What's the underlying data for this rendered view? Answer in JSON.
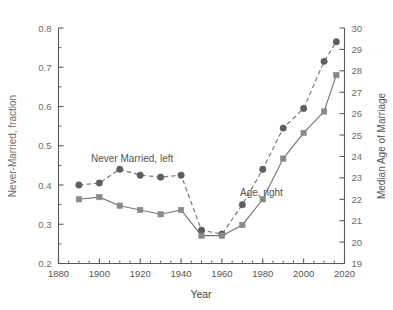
{
  "chart_data": {
    "type": "line",
    "title": "",
    "xlabel": "Year",
    "ylabel": "Never-Married, fraction",
    "y2label": "Median Age of Marriage",
    "xlim": [
      1880,
      2020
    ],
    "ylim": [
      0.2,
      0.8
    ],
    "y2lim": [
      19,
      30
    ],
    "grid": false,
    "legend_position": "inline-annotations",
    "x_ticks": [
      1880,
      1900,
      1920,
      1940,
      1960,
      1980,
      2000,
      2020
    ],
    "x_minor_step": 5,
    "y_ticks": [
      0.2,
      0.3,
      0.4,
      0.5,
      0.6,
      0.7,
      0.8
    ],
    "y_minor_step": 0.05,
    "y2_ticks": [
      19,
      20,
      21,
      22,
      23,
      24,
      25,
      26,
      27,
      28,
      29,
      30
    ],
    "annotations": [
      {
        "text": "Never Married, left",
        "x": 1905,
        "y": 0.5
      },
      {
        "text": "Age, right",
        "x": 1985,
        "y": 0.405
      }
    ],
    "x": [
      1890,
      1900,
      1910,
      1920,
      1930,
      1940,
      1950,
      1960,
      1970,
      1980,
      1990,
      2000,
      2010,
      2016
    ],
    "series": [
      {
        "name": "Never Married, left",
        "axis": "left",
        "marker": "circle",
        "linestyle": "dashed",
        "color": "#5e5e5e",
        "values": [
          0.4,
          0.405,
          0.44,
          0.425,
          0.42,
          0.425,
          0.285,
          0.275,
          0.35,
          0.44,
          0.545,
          0.595,
          0.715,
          0.765
        ]
      },
      {
        "name": "Age, right",
        "axis": "right",
        "marker": "square",
        "linestyle": "solid",
        "color": "#8a8a8a",
        "values": [
          22.0,
          22.1,
          21.7,
          21.5,
          21.3,
          21.5,
          20.3,
          20.3,
          20.8,
          22.0,
          23.9,
          25.1,
          26.1,
          27.8
        ]
      }
    ]
  }
}
